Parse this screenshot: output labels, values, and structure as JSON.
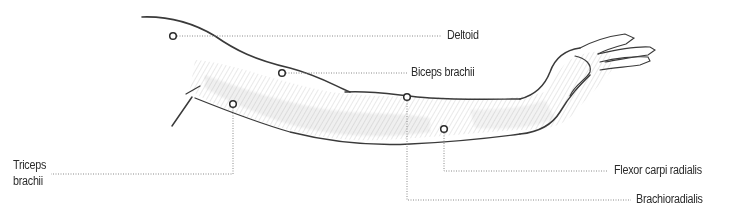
{
  "diagram": {
    "colors": {
      "ink": "#2b2b2b",
      "leader": "#8a8a8a",
      "shade": "#7d7d7d",
      "background": "#ffffff"
    },
    "labels": {
      "deltoid": "Deltoid",
      "biceps": "Biceps brachii",
      "triceps_line1": "Triceps",
      "triceps_line2": "brachii",
      "flexor": "Flexor carpi radialis",
      "brachioradialis": "Brachioradialis"
    },
    "markers": [
      {
        "name": "deltoid",
        "x": 173,
        "y": 36
      },
      {
        "name": "biceps-brachii",
        "x": 282,
        "y": 73
      },
      {
        "name": "triceps-brachii",
        "x": 233,
        "y": 104
      },
      {
        "name": "brachioradialis",
        "x": 407,
        "y": 97
      },
      {
        "name": "flexor-carpi-radialis",
        "x": 444,
        "y": 129
      }
    ]
  }
}
